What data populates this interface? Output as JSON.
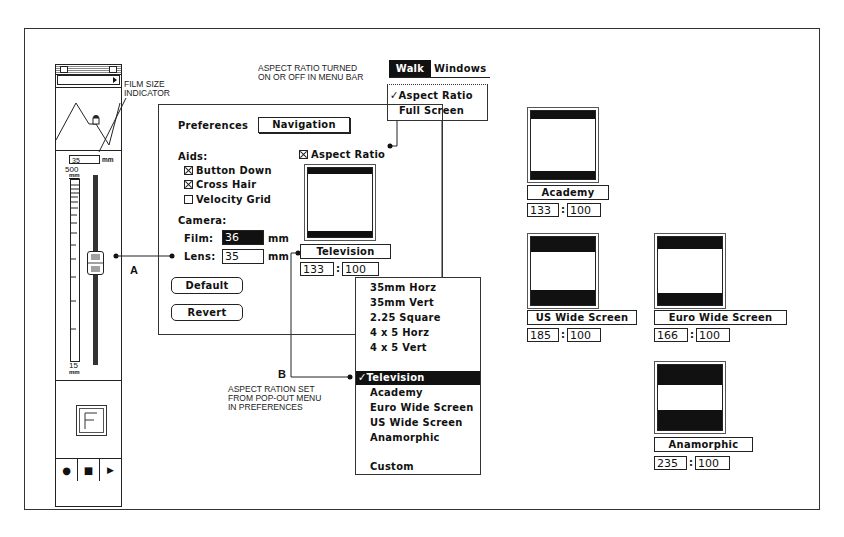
{
  "annotations": {
    "film_size": [
      "FILM SIZE",
      "INDICATOR"
    ],
    "aspect_menu": [
      "ASPECT RATIO TURNED",
      "ON OR OFF IN MENU BAR"
    ],
    "popout": [
      "ASPECT RATION SET",
      "FROM POP-OUT MENU",
      "IN PREFERENCES"
    ],
    "label_a": "A",
    "label_b": "B"
  },
  "navigator": {
    "film_size_value": "35",
    "film_size_unit": "mm",
    "scale_max": "500",
    "scale_max_unit": "mm",
    "scale_min": "15",
    "scale_min_unit": "mm",
    "controls": [
      {
        "name": "record",
        "glyph": "●"
      },
      {
        "name": "stop",
        "glyph": "■"
      },
      {
        "name": "play",
        "glyph": "▶"
      }
    ]
  },
  "menubar": {
    "items": [
      "Walk",
      "Windows"
    ],
    "walk_menu": [
      {
        "label": "Aspect Ratio",
        "checked": true,
        "check": "✓"
      },
      {
        "label": "Full Screen",
        "checked": false
      }
    ]
  },
  "preferences": {
    "title": "Preferences",
    "section_dropdown": "Navigation",
    "aids_label": "Aids:",
    "aids": [
      {
        "label": "Button Down",
        "checked": true
      },
      {
        "label": "Cross Hair",
        "checked": true
      },
      {
        "label": "Velocity Grid",
        "checked": false
      }
    ],
    "aspect_ratio_checkbox": {
      "label": "Aspect Ratio",
      "checked": true
    },
    "camera_label": "Camera:",
    "film_label": "Film:",
    "film_value": "36",
    "lens_label": "Lens:",
    "lens_value": "35",
    "unit": "mm",
    "default_button": "Default",
    "revert_button": "Revert",
    "aspect_preset": "Television",
    "ratio_w": "133",
    "ratio_sep": ":",
    "ratio_h": "100"
  },
  "popup_menu": {
    "items": [
      {
        "label": "35mm Horz"
      },
      {
        "label": "35mm Vert"
      },
      {
        "label": "2.25 Square"
      },
      {
        "label": "4 x 5 Horz"
      },
      {
        "label": "4 x 5 Vert"
      },
      {
        "label": ""
      },
      {
        "label": "Television",
        "selected": true,
        "check": "✓"
      },
      {
        "label": "Academy"
      },
      {
        "label": "Euro Wide Screen"
      },
      {
        "label": "US Wide Screen"
      },
      {
        "label": "Anamorphic"
      },
      {
        "label": ""
      },
      {
        "label": "Custom"
      }
    ]
  },
  "examples": [
    {
      "name": "Academy",
      "w": "133",
      "h": "100"
    },
    {
      "name": "US Wide Screen",
      "w": "185",
      "h": "100"
    },
    {
      "name": "Euro Wide Screen",
      "w": "166",
      "h": "100"
    },
    {
      "name": "Anamorphic",
      "w": "235",
      "h": "100"
    }
  ]
}
